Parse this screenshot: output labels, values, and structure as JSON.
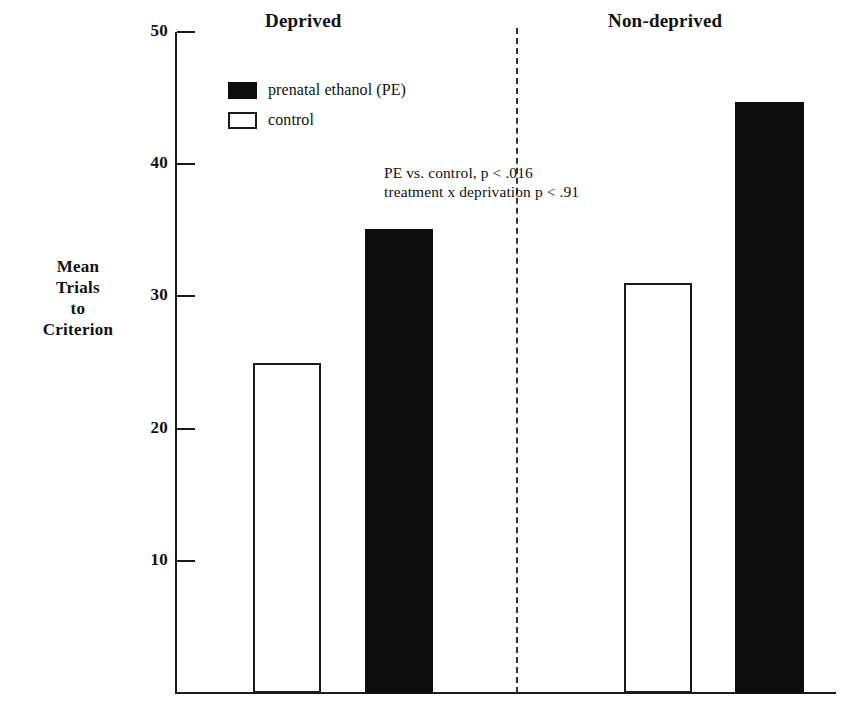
{
  "chart_data": {
    "type": "bar",
    "title": "",
    "xlabel": "",
    "ylabel": "Mean Trials to Criterion",
    "ylabel_lines": [
      "Mean",
      "Trials",
      "to",
      "Criterion"
    ],
    "ylim": [
      0,
      50
    ],
    "yticks": [
      10,
      20,
      30,
      40,
      50
    ],
    "ytick_labels": [
      "10",
      "20",
      "30",
      "40",
      "50"
    ],
    "grid": false,
    "legend_position": "upper-left-inside",
    "categories": [
      "Deprived",
      "Non-deprived"
    ],
    "series": [
      {
        "name": "control",
        "style": "open",
        "color": "#ffffff",
        "edge_color": "#1a1a1a",
        "values": [
          25,
          31
        ]
      },
      {
        "name": "prenatal ethanol (PE)",
        "style": "filled",
        "color": "#0d0d0d",
        "edge_color": "#0d0d0d",
        "values": [
          35.1,
          44.7
        ]
      }
    ],
    "bars": [
      {
        "group": "Deprived",
        "series": "control",
        "label": "control",
        "value": 25,
        "style": "open"
      },
      {
        "group": "Deprived",
        "series": "prenatal ethanol (PE)",
        "label": "prenatal ethanol (PE)",
        "value": 35.1,
        "style": "filled"
      },
      {
        "group": "Non-deprived",
        "series": "control",
        "label": "control",
        "value": 31,
        "style": "open"
      },
      {
        "group": "Non-deprived",
        "series": "prenatal ethanol (PE)",
        "label": "prenatal ethanol (PE)",
        "value": 44.7,
        "style": "filled"
      }
    ],
    "annotations": [
      "PE vs. control, p < .016",
      "treatment x deprivation p < .91"
    ],
    "divider": {
      "type": "dashed-vertical",
      "between": [
        "Deprived",
        "Non-deprived"
      ]
    }
  },
  "groups": [
    {
      "label": "Deprived"
    },
    {
      "label": "Non-deprived"
    }
  ],
  "legend": {
    "items": [
      {
        "label": "prenatal ethanol (PE)",
        "style": "filled"
      },
      {
        "label": "control",
        "style": "open"
      }
    ]
  },
  "axis": {
    "y_title_lines": [
      "Mean",
      "Trials",
      "to",
      "Criterion"
    ],
    "ticks": [
      {
        "label": "50",
        "value": 50
      },
      {
        "label": "40",
        "value": 40
      },
      {
        "label": "30",
        "value": 30
      },
      {
        "label": "20",
        "value": 20
      },
      {
        "label": "10",
        "value": 10
      }
    ]
  },
  "annotation": {
    "line1": "PE vs. control, p < .016",
    "line2": "treatment x deprivation p < .91"
  }
}
